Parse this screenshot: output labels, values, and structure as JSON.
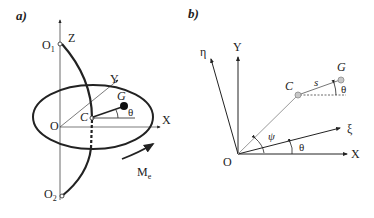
{
  "panel_a": {
    "label": "a)",
    "axes": {
      "z": "Z",
      "y": "Y",
      "x": "X"
    },
    "points": {
      "o1": "O",
      "o1_sub": "1",
      "o2": "O",
      "o2_sub": "2",
      "o": "O",
      "c": "C",
      "g": "G"
    },
    "angle": "θ",
    "moment": "M",
    "moment_sub": "e"
  },
  "panel_b": {
    "label": "b)",
    "axes": {
      "eta": "η",
      "y": "Y",
      "xi": "ξ",
      "x": "X"
    },
    "points": {
      "o": "O",
      "c": "C",
      "g": "G"
    },
    "segment": "s",
    "angle_psi": "ψ",
    "angle_theta_axis": "θ",
    "angle_theta_g": "θ"
  },
  "colors": {
    "stroke": "#222222",
    "light_stroke": "#9a9a9a",
    "point_fill": "#bbbbbb"
  }
}
